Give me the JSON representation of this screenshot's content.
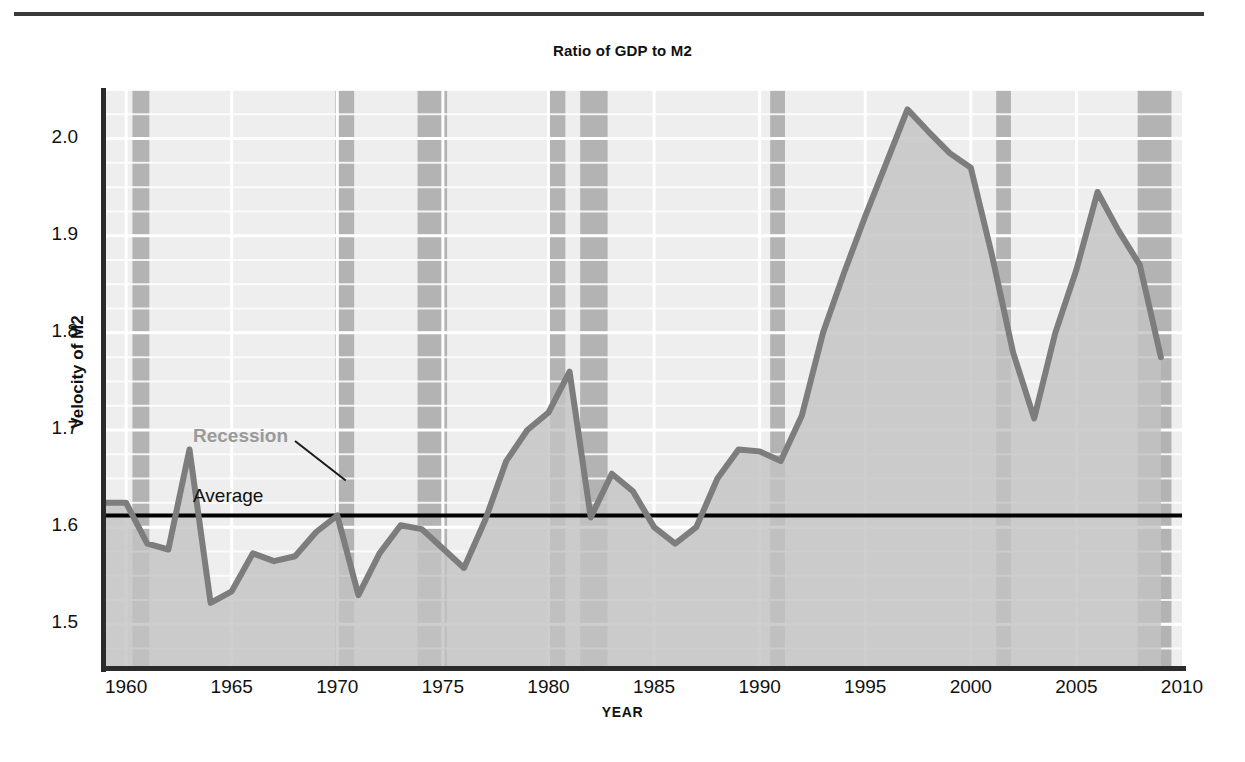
{
  "figure": {
    "title": "Ratio of GDP to M2",
    "x_axis_title": "YEAR",
    "y_axis_title": "Velocity of M2"
  },
  "annotations": {
    "recession_label": "Recession",
    "average_label": "Average"
  },
  "colors": {
    "plot_background": "#eeeeee",
    "area_fill": "#c3c3c3",
    "recession_band": "#b3b3b3",
    "series_line": "#7d7d7d",
    "average_line": "#000000",
    "gridline": "#ffffff",
    "axis": "#2b2b2b",
    "recession_text": "#9a9a9a"
  },
  "chart_data": {
    "type": "line",
    "title": "Ratio of GDP to M2",
    "xlabel": "YEAR",
    "ylabel": "Velocity of M2",
    "xlim": [
      1959,
      2010
    ],
    "ylim": [
      1.455,
      2.05
    ],
    "grid": true,
    "legend": "none",
    "xticks": [
      1960,
      1965,
      1970,
      1975,
      1980,
      1985,
      1990,
      1995,
      2000,
      2005,
      2010
    ],
    "yticks": [
      1.5,
      1.6,
      1.7,
      1.8,
      1.9,
      2.0
    ],
    "ytick_labels": [
      "1.5",
      "1.6",
      "1.7",
      "1.8",
      "1.9",
      "2.0"
    ],
    "xtick_labels": [
      "1960",
      "1965",
      "1970",
      "1975",
      "1980",
      "1985",
      "1990",
      "1995",
      "2000",
      "2005",
      "2010"
    ],
    "minor_gridline_step": 0.025,
    "series": [
      {
        "name": "Velocity of M2",
        "fill_to_baseline": true,
        "x": [
          1959,
          1960,
          1961,
          1962,
          1963,
          1964,
          1965,
          1966,
          1967,
          1968,
          1969,
          1970,
          1971,
          1972,
          1973,
          1974,
          1975,
          1976,
          1977,
          1978,
          1979,
          1980,
          1981,
          1982,
          1983,
          1984,
          1985,
          1986,
          1987,
          1988,
          1989,
          1990,
          1991,
          1992,
          1993,
          1994,
          1995,
          1996,
          1997,
          1998,
          1999,
          2000,
          2001,
          2002,
          2003,
          2004,
          2005,
          2006,
          2007,
          2008,
          2009
        ],
        "values": [
          1.625,
          1.625,
          1.583,
          1.577,
          1.68,
          1.522,
          1.534,
          1.573,
          1.565,
          1.57,
          1.595,
          1.612,
          1.53,
          1.573,
          1.602,
          1.598,
          1.578,
          1.558,
          1.607,
          1.668,
          1.7,
          1.718,
          1.76,
          1.61,
          1.655,
          1.637,
          1.6,
          1.583,
          1.6,
          1.65,
          1.68,
          1.678,
          1.668,
          1.715,
          1.8,
          1.862,
          1.92,
          1.975,
          2.03,
          2.007,
          1.985,
          1.97,
          1.88,
          1.78,
          1.712,
          1.8,
          1.865,
          1.945,
          1.905,
          1.87,
          1.775
        ]
      }
    ],
    "average_line": {
      "label": "Average",
      "value": 1.612
    },
    "recession_bands": [
      {
        "start": 1960.3,
        "end": 1961.1
      },
      {
        "start": 1969.9,
        "end": 1970.8
      },
      {
        "start": 1973.8,
        "end": 1975.2
      },
      {
        "start": 1980.0,
        "end": 1980.8
      },
      {
        "start": 1981.5,
        "end": 1982.8
      },
      {
        "start": 1990.5,
        "end": 1991.2
      },
      {
        "start": 2001.2,
        "end": 2001.9
      },
      {
        "start": 2007.9,
        "end": 2009.5
      }
    ]
  }
}
